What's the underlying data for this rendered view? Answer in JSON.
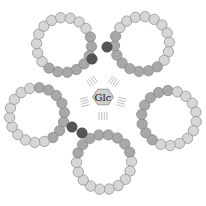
{
  "diagram": {
    "center_label": "Glc",
    "colors": {
      "background": "#ffffff",
      "bead_light": "#d6d6d6",
      "bead_medium": "#a8a8a8",
      "bead_dark": "#555555",
      "bead_stroke": "#7a7a7a",
      "ring_inner": "#ffffff",
      "hatch": "#bdbdbd",
      "hex_fill": "#cfcfcf",
      "hex_stroke": "#8a8a8a"
    },
    "center": {
      "x": 103,
      "y": 97
    },
    "bead_radius": 5.2,
    "rings": [
      {
        "name": "ring-top-left",
        "cx": 64,
        "cy": 45,
        "r": 27.5,
        "beads": 18
      },
      {
        "name": "ring-top-right",
        "cx": 142,
        "cy": 44,
        "r": 27.5,
        "beads": 18
      },
      {
        "name": "ring-right",
        "cx": 169,
        "cy": 118,
        "r": 27.5,
        "beads": 18
      },
      {
        "name": "ring-bottom",
        "cx": 104,
        "cy": 162,
        "r": 27.5,
        "beads": 18
      },
      {
        "name": "ring-left",
        "cx": 37,
        "cy": 115,
        "r": 27.5,
        "beads": 18
      }
    ],
    "dark_beads": [
      {
        "x": 92,
        "y": 59
      },
      {
        "x": 107,
        "y": 47
      },
      {
        "x": 72,
        "y": 127
      },
      {
        "x": 82,
        "y": 133
      }
    ],
    "hatch_groups": [
      {
        "angle": -125
      },
      {
        "angle": -55
      },
      {
        "angle": 15
      },
      {
        "angle": 90
      },
      {
        "angle": 165
      }
    ]
  }
}
